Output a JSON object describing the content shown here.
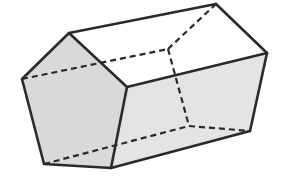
{
  "figure": {
    "type": "pentagonal-prism",
    "colors": {
      "edge": "#2a2a2a",
      "front_face": "#d9d9d9",
      "lower_side_face": "#e4e4e4",
      "top_faces": "#ffffff"
    },
    "vertices": {
      "front": [
        [
          69,
          33
        ],
        [
          127,
          87
        ],
        [
          111,
          168
        ],
        [
          44,
          164
        ],
        [
          22,
          79
        ]
      ],
      "back": [
        [
          216,
          4
        ],
        [
          267,
          53
        ],
        [
          250,
          131
        ],
        [
          189,
          126
        ],
        [
          168,
          49
        ]
      ]
    },
    "visible_edges": [
      [
        [
          69,
          33
        ],
        [
          127,
          87
        ]
      ],
      [
        [
          127,
          87
        ],
        [
          111,
          168
        ]
      ],
      [
        [
          111,
          168
        ],
        [
          44,
          164
        ]
      ],
      [
        [
          44,
          164
        ],
        [
          22,
          79
        ]
      ],
      [
        [
          22,
          79
        ],
        [
          69,
          33
        ]
      ],
      [
        [
          69,
          33
        ],
        [
          216,
          4
        ]
      ],
      [
        [
          127,
          87
        ],
        [
          267,
          53
        ]
      ],
      [
        [
          111,
          168
        ],
        [
          250,
          131
        ]
      ],
      [
        [
          216,
          4
        ],
        [
          267,
          53
        ]
      ],
      [
        [
          267,
          53
        ],
        [
          250,
          131
        ]
      ]
    ],
    "hidden_edges": [
      [
        [
          22,
          79
        ],
        [
          168,
          49
        ]
      ],
      [
        [
          44,
          164
        ],
        [
          189,
          126
        ]
      ],
      [
        [
          168,
          49
        ],
        [
          216,
          4
        ]
      ],
      [
        [
          168,
          49
        ],
        [
          189,
          126
        ]
      ],
      [
        [
          189,
          126
        ],
        [
          250,
          131
        ]
      ]
    ]
  }
}
